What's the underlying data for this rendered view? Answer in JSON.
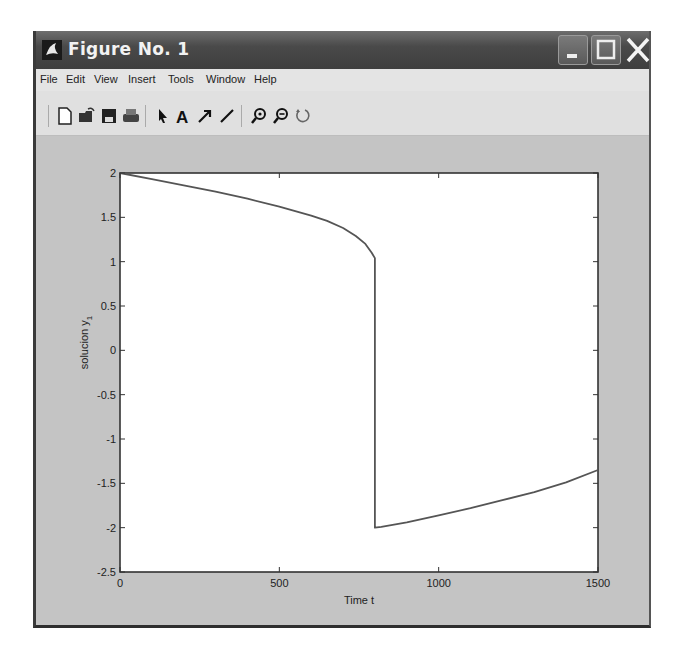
{
  "window": {
    "title": "Figure No. 1",
    "controls": {
      "minimize": "minimize",
      "maximize": "maximize",
      "close": "close"
    }
  },
  "menubar": {
    "items": [
      "File",
      "Edit",
      "View",
      "Insert",
      "Tools",
      "Window",
      "Help"
    ]
  },
  "toolbar": {
    "buttons": [
      {
        "name": "new-figure",
        "icon": "new-document-icon"
      },
      {
        "name": "open-file",
        "icon": "open-folder-icon"
      },
      {
        "name": "save",
        "icon": "save-disk-icon"
      },
      {
        "name": "print",
        "icon": "printer-icon"
      },
      {
        "name": "edit-plot",
        "icon": "arrow-pointer-icon"
      },
      {
        "name": "insert-text",
        "icon": "text-a-icon"
      },
      {
        "name": "insert-arrow",
        "icon": "arrow-icon"
      },
      {
        "name": "insert-line",
        "icon": "line-icon"
      },
      {
        "name": "zoom-in",
        "icon": "zoom-in-icon"
      },
      {
        "name": "zoom-out",
        "icon": "zoom-out-icon"
      },
      {
        "name": "rotate-3d",
        "icon": "rotate-icon"
      }
    ]
  },
  "chart_data": {
    "type": "line",
    "title": "",
    "xlabel": "Time t",
    "ylabel": "solucion y",
    "ylabel_subscript": "1",
    "xlim": [
      0,
      1500
    ],
    "ylim": [
      -2.5,
      2
    ],
    "xticks": [
      0,
      500,
      1000,
      1500
    ],
    "xtick_labels": [
      "0",
      "500",
      "1000",
      "1500"
    ],
    "yticks": [
      2,
      1.5,
      1,
      0.5,
      0,
      -0.5,
      -1,
      -1.5,
      -2,
      -2.5
    ],
    "ytick_labels": [
      "2",
      "1.5",
      "1",
      "0.5",
      "0",
      "-0.5",
      "-1",
      "-1.5",
      "-2",
      "-2.5"
    ],
    "grid": false,
    "legend": null,
    "series": [
      {
        "name": "y1",
        "color": "#555555",
        "x": [
          0,
          100,
          200,
          300,
          400,
          500,
          600,
          650,
          700,
          740,
          770,
          790,
          800,
          800,
          820,
          900,
          1000,
          1100,
          1200,
          1300,
          1400,
          1500
        ],
        "y": [
          2.0,
          1.93,
          1.86,
          1.79,
          1.71,
          1.62,
          1.52,
          1.46,
          1.38,
          1.29,
          1.2,
          1.1,
          1.04,
          -2.0,
          -1.99,
          -1.94,
          -1.86,
          -1.78,
          -1.69,
          -1.6,
          -1.49,
          -1.35
        ]
      }
    ]
  }
}
